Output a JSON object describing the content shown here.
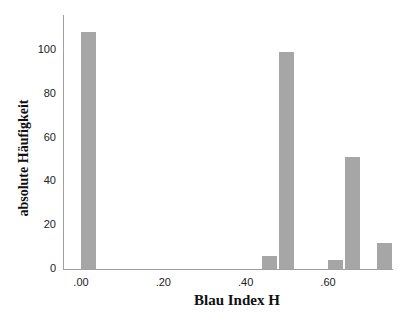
{
  "chart_data": {
    "type": "bar",
    "title": "",
    "xlabel": "Blau Index H",
    "ylabel": "absolute Häufigkeit",
    "x_tick_labels": [
      ".00",
      ".20",
      ".40",
      ".60"
    ],
    "y_tick_labels": [
      "0",
      "20",
      "40",
      "60",
      "80",
      "100"
    ],
    "ylim": [
      0,
      115
    ],
    "xlim": [
      -0.02,
      0.76
    ],
    "grid": false,
    "legend": null,
    "bars": [
      {
        "x": 0.01,
        "value": 108
      },
      {
        "x": 0.46,
        "value": 6
      },
      {
        "x": 0.5,
        "value": 99
      },
      {
        "x": 0.64,
        "value": 4
      },
      {
        "x": 0.67,
        "value": 51
      },
      {
        "x": 0.74,
        "value": 12
      }
    ]
  }
}
